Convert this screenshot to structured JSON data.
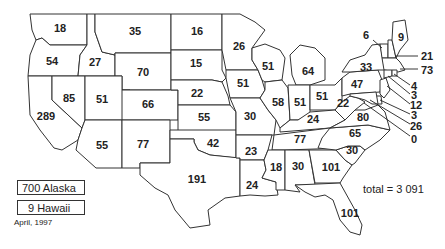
{
  "map": {
    "title": "",
    "date_label": "April, 1997",
    "total_label": "total = 3 091",
    "insets": [
      {
        "state": "Alaska",
        "value": 700,
        "label": "700 Alaska"
      },
      {
        "state": "Hawaii",
        "value": 9,
        "label": "9 Hawaii"
      }
    ],
    "states": [
      {
        "state": "Washington",
        "value": "18"
      },
      {
        "state": "Oregon",
        "value": "54"
      },
      {
        "state": "California",
        "value": "289"
      },
      {
        "state": "Idaho",
        "value": "27"
      },
      {
        "state": "Nevada",
        "value": "85"
      },
      {
        "state": "Montana",
        "value": "35"
      },
      {
        "state": "Wyoming",
        "value": "70"
      },
      {
        "state": "Utah",
        "value": "51"
      },
      {
        "state": "Colorado",
        "value": "66"
      },
      {
        "state": "Arizona",
        "value": "55"
      },
      {
        "state": "New Mexico",
        "value": "77"
      },
      {
        "state": "North Dakota",
        "value": "16"
      },
      {
        "state": "South Dakota",
        "value": "15"
      },
      {
        "state": "Nebraska",
        "value": "22"
      },
      {
        "state": "Kansas",
        "value": "55"
      },
      {
        "state": "Oklahoma",
        "value": "42"
      },
      {
        "state": "Texas",
        "value": "191"
      },
      {
        "state": "Minnesota",
        "value": "26"
      },
      {
        "state": "Iowa",
        "value": "51"
      },
      {
        "state": "Missouri",
        "value": "30"
      },
      {
        "state": "Arkansas",
        "value": "23"
      },
      {
        "state": "Louisiana",
        "value": "24"
      },
      {
        "state": "Wisconsin",
        "value": "51"
      },
      {
        "state": "Illinois",
        "value": "58"
      },
      {
        "state": "Michigan",
        "value": "64"
      },
      {
        "state": "Indiana",
        "value": "51"
      },
      {
        "state": "Ohio",
        "value": "51"
      },
      {
        "state": "Kentucky",
        "value": "24"
      },
      {
        "state": "Tennessee",
        "value": "77"
      },
      {
        "state": "Mississippi",
        "value": "18"
      },
      {
        "state": "Alabama",
        "value": "30"
      },
      {
        "state": "Georgia",
        "value": "101"
      },
      {
        "state": "Florida",
        "value": "101"
      },
      {
        "state": "South Carolina",
        "value": "30"
      },
      {
        "state": "North Carolina",
        "value": "65"
      },
      {
        "state": "Virginia",
        "value": "80"
      },
      {
        "state": "West Virginia",
        "value": "22"
      },
      {
        "state": "Pennsylvania",
        "value": "47"
      },
      {
        "state": "New York",
        "value": "33"
      },
      {
        "state": "Vermont",
        "value": "6"
      },
      {
        "state": "Maine",
        "value": "9"
      },
      {
        "state": "New Hampshire",
        "value": "21"
      },
      {
        "state": "Massachusetts",
        "value": "73"
      },
      {
        "state": "Rhode Island",
        "value": "4"
      },
      {
        "state": "Connecticut",
        "value": "3"
      },
      {
        "state": "New Jersey",
        "value": "12"
      },
      {
        "state": "Delaware",
        "value": "3"
      },
      {
        "state": "Maryland",
        "value": "26"
      },
      {
        "state": "District of Columbia",
        "value": "0"
      }
    ]
  }
}
